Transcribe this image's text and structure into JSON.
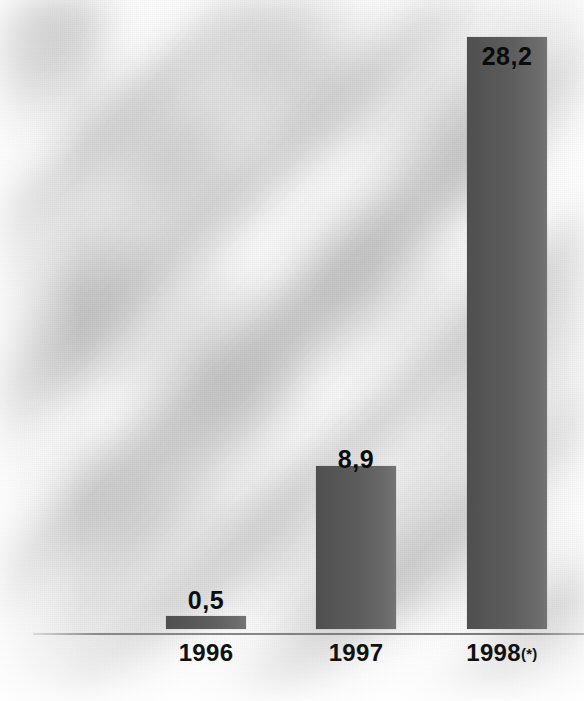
{
  "chart_data": {
    "type": "bar",
    "title": "",
    "subtitle": "",
    "xlabel": "",
    "ylabel": "",
    "categories": [
      "1996",
      "1997",
      "1998(*)"
    ],
    "values": [
      0.5,
      8.9,
      28.2
    ],
    "value_labels": [
      "0,5",
      "8,9",
      "28,2"
    ],
    "decimal_separator": ",",
    "ylim": [
      0,
      28.2
    ],
    "grid": false,
    "legend": null,
    "legend_position": "none",
    "axis": {
      "baseline_visible": true,
      "y_axis_visible": false,
      "tick_marks": false
    },
    "annotations": [
      {
        "text": "(*)",
        "attached_to": "1998",
        "meaning_shown": false
      }
    ],
    "series": [
      {
        "name": "",
        "values": [
          0.5,
          8.9,
          28.2
        ],
        "bar_color": "#5a5a5a",
        "bar_gradient_from": "#4f4f4f",
        "bar_gradient_to": "#747474"
      }
    ]
  },
  "bars": [
    {
      "category": "1996",
      "value_label": "0,5",
      "label_placement": "above-bar"
    },
    {
      "category": "1997",
      "value_label": "8,9",
      "label_placement": "inside-top"
    },
    {
      "category": "1998(*)",
      "value_label": "28,2",
      "label_placement": "inside-top"
    }
  ],
  "ticks": [
    {
      "main": "1996",
      "note": ""
    },
    {
      "main": "1997",
      "note": ""
    },
    {
      "main": "1998",
      "note": "(*)"
    }
  ],
  "colors": {
    "bar": "#5a5a5a",
    "bar_light": "#747474",
    "bar_dark": "#4f4f4f",
    "label_text": "#0d0d0d",
    "axis_line": "#787878",
    "background": "#fcfcfc"
  },
  "accessibility": {
    "description": "Bar chart with three bars showing values 0,5 for 1996; 8,9 for 1997; and 28,2 for 1998 with an asterisk note."
  }
}
